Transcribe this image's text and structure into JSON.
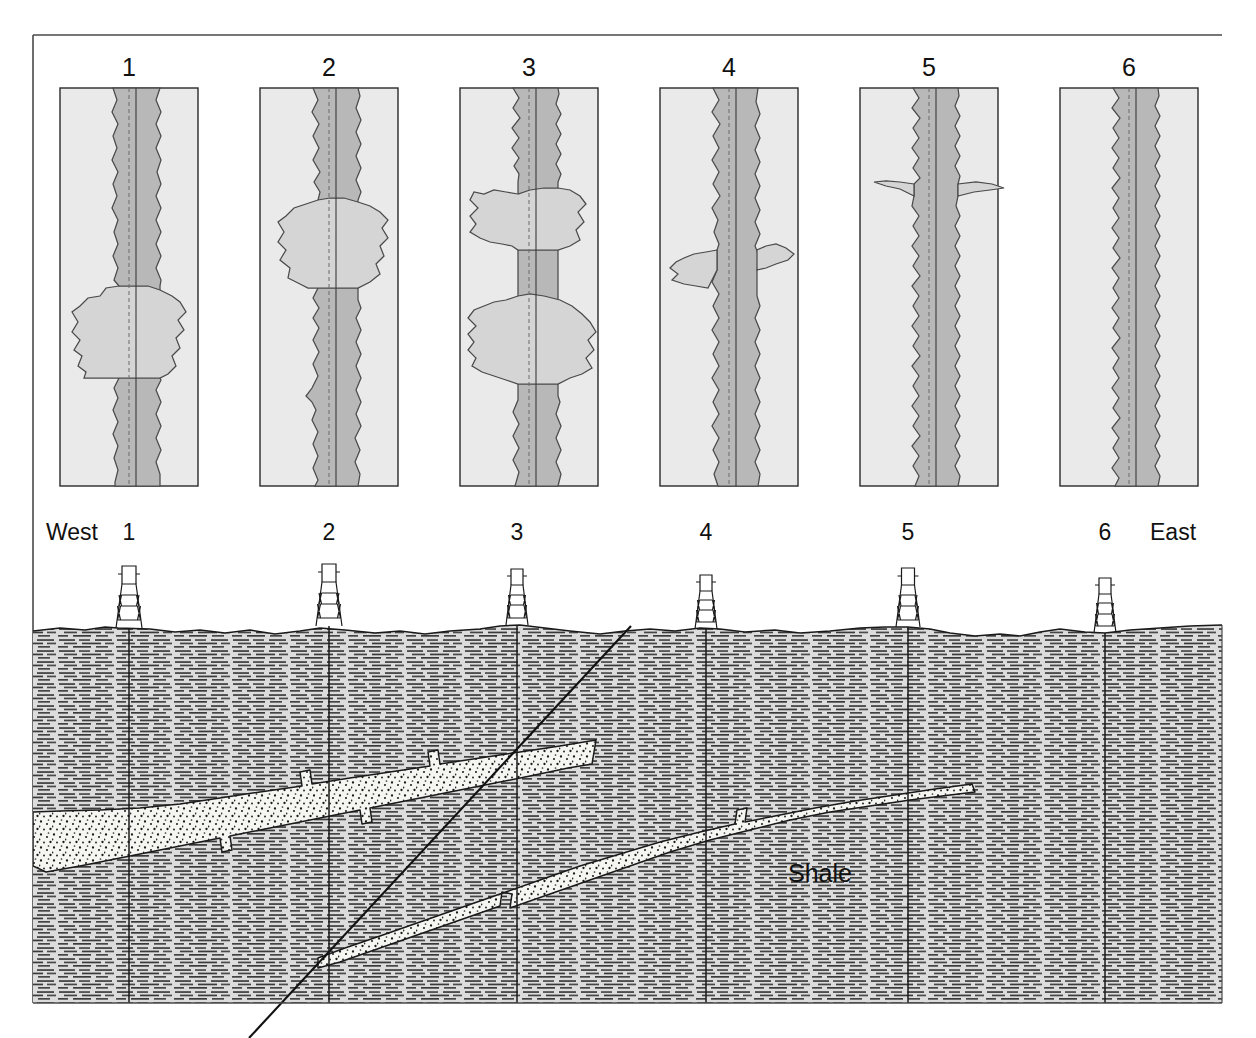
{
  "figure": {
    "orientation_left_label": "West",
    "orientation_right_label": "East",
    "unit_label": "Shale",
    "background_color": "#ffffff"
  },
  "colors": {
    "line": "#1a1a1a",
    "log_track_bg": "#e9e9e9",
    "log_shale_fill": "#b9b9b9",
    "log_sand_fill": "#d6d6d6",
    "shale_unit_fill": "#d9d9d9",
    "shale_dash": "#3a3a3a",
    "sand_unit_fill": "#f4f4f1",
    "sand_stipple": "#1a1a1a",
    "wellbore": "#1a1a1a",
    "fault": "#111111"
  },
  "log_panel": {
    "count": 6,
    "labels": [
      "1",
      "2",
      "3",
      "4",
      "5",
      "6"
    ],
    "track_x": [
      60,
      260,
      460,
      660,
      860,
      1060
    ],
    "track_y": 88,
    "track_width": 138,
    "track_height": 398,
    "label_y": 76,
    "logs": [
      {
        "id": "log-1",
        "label": "1",
        "sand_intervals": [
          {
            "top_frac": 0.5,
            "bottom_frac": 0.73,
            "max_amplitude": 0.94,
            "shape": "blocky-bell"
          }
        ],
        "description": "Thick blocky sand with sharp base, mid-depth"
      },
      {
        "id": "log-2",
        "label": "2",
        "sand_intervals": [
          {
            "top_frac": 0.33,
            "bottom_frac": 0.51,
            "max_amplitude": 0.82,
            "shape": "blocky"
          }
        ],
        "description": "Moderately thick sand in upper-middle interval"
      },
      {
        "id": "log-3",
        "label": "3",
        "sand_intervals": [
          {
            "top_frac": 0.25,
            "bottom_frac": 0.37,
            "max_amplitude": 0.8,
            "shape": "blocky"
          },
          {
            "top_frac": 0.55,
            "bottom_frac": 0.7,
            "max_amplitude": 0.82,
            "shape": "blocky"
          }
        ],
        "description": "Two separate sand intervals separated by shale break"
      },
      {
        "id": "log-4",
        "label": "4",
        "sand_intervals": [
          {
            "top_frac": 0.44,
            "bottom_frac": 0.55,
            "max_amplitude": 0.52,
            "shape": "thin"
          }
        ],
        "description": "Thin sand at mid-depth"
      },
      {
        "id": "log-5",
        "label": "5",
        "sand_intervals": [
          {
            "top_frac": 0.245,
            "bottom_frac": 0.285,
            "max_amplitude": 0.6,
            "shape": "spike"
          }
        ],
        "description": "Very thin sand stringer"
      },
      {
        "id": "log-6",
        "label": "6",
        "sand_intervals": [],
        "description": "All shale, no sand development"
      }
    ]
  },
  "cross_section": {
    "wells": [
      {
        "label": "1",
        "x": 129,
        "surface_y": 628,
        "td_y": 1003
      },
      {
        "label": "2",
        "x": 329,
        "surface_y": 626,
        "td_y": 1003
      },
      {
        "label": "3",
        "x": 517,
        "surface_y": 625,
        "td_y": 1003
      },
      {
        "label": "4",
        "x": 706,
        "surface_y": 629,
        "td_y": 1003
      },
      {
        "label": "5",
        "x": 908,
        "surface_y": 627,
        "td_y": 1003
      },
      {
        "label": "6",
        "x": 1105,
        "surface_y": 633,
        "td_y": 1003
      }
    ],
    "well_label_y": 540,
    "west_label": {
      "text": "West",
      "x": 46,
      "y": 540
    },
    "east_label": {
      "text": "East",
      "x": 1150,
      "y": 540
    },
    "shale_label": {
      "text": "Shale",
      "x": 820,
      "y": 882
    },
    "frame": {
      "x": 33,
      "y": 620,
      "width": 1189,
      "height": 383
    },
    "fault": {
      "type": "normal",
      "top_point": [
        631,
        626
      ],
      "bottom_point": [
        249,
        1038
      ],
      "dip_direction": "west"
    },
    "sand_bodies": [
      {
        "id": "upper-sand",
        "name": "Upper sandstone",
        "footwall_side": "west",
        "description": "Upper sand body, truncated at the fault, thins and pinches east"
      },
      {
        "id": "lower-sand",
        "name": "Lower sandstone",
        "footwall_side": "east",
        "description": "Lower sand body on downthrown block, pinches out east of well 4"
      }
    ]
  }
}
